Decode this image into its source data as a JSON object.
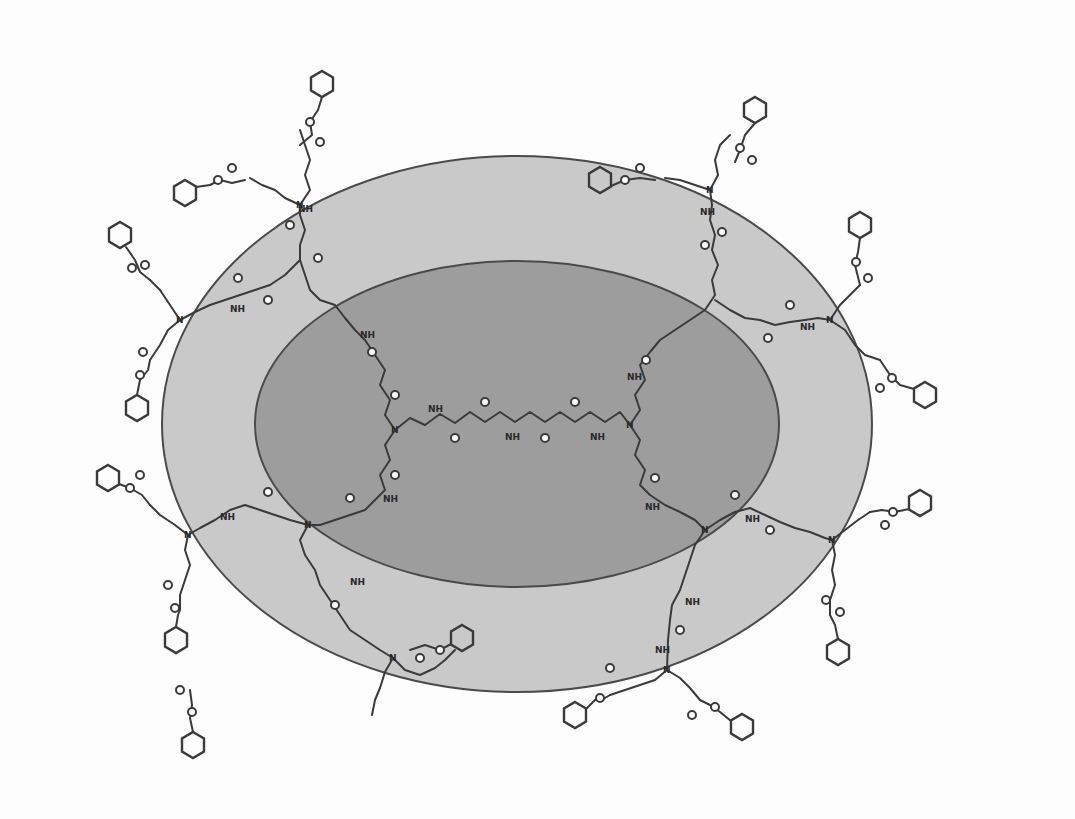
{
  "diagram": {
    "type": "dendrimer-structure",
    "shells": [
      {
        "name": "outer-shell",
        "color": "#c9c9c9",
        "cx": 517,
        "cy": 424,
        "rx": 355,
        "ry": 268
      },
      {
        "name": "inner-core",
        "color": "#9d9d9d",
        "cx": 517,
        "cy": 424,
        "rx": 262,
        "ry": 163
      }
    ],
    "labels": {
      "nh": "NH",
      "n": "N",
      "o": "O"
    },
    "terminal_groups": {
      "count": 16,
      "description": "benzyl carbamate (Cbz) end groups",
      "positions": [
        [
          195,
          107
        ],
        [
          755,
          110
        ],
        [
          120,
          235
        ],
        [
          860,
          225
        ],
        [
          137,
          408
        ],
        [
          925,
          395
        ],
        [
          108,
          478
        ],
        [
          920,
          503
        ],
        [
          176,
          640
        ],
        [
          838,
          652
        ],
        [
          462,
          638
        ],
        [
          193,
          745
        ],
        [
          575,
          715
        ],
        [
          742,
          727
        ],
        [
          183,
          165
        ],
        [
          600,
          180
        ]
      ]
    },
    "branch_points": [
      [
        395,
        430
      ],
      [
        630,
        425
      ],
      [
        300,
        205
      ],
      [
        710,
        190
      ],
      [
        180,
        320
      ],
      [
        830,
        320
      ],
      [
        188,
        535
      ],
      [
        832,
        540
      ],
      [
        308,
        525
      ],
      [
        705,
        530
      ],
      [
        393,
        658
      ],
      [
        667,
        670
      ]
    ]
  }
}
